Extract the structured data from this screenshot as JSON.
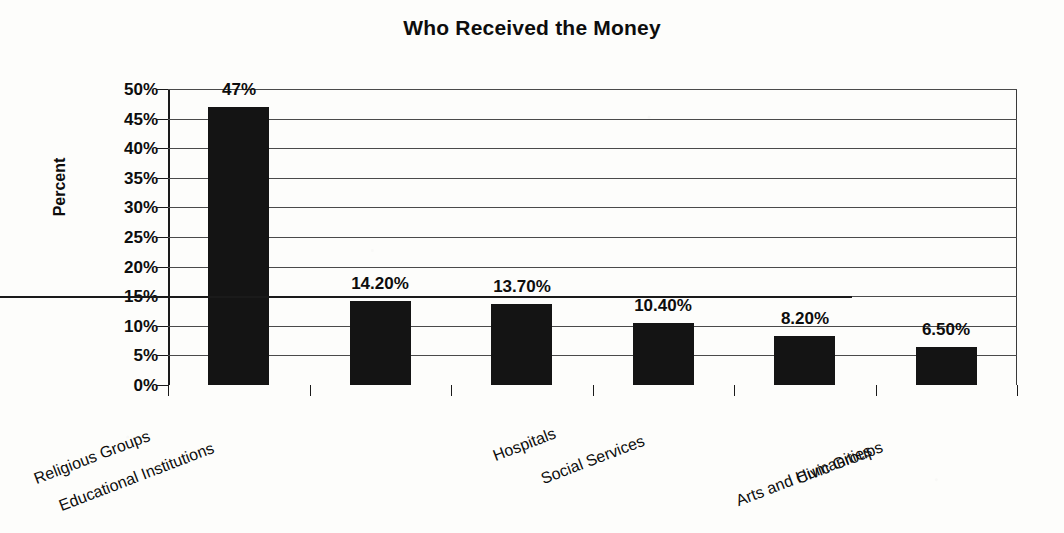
{
  "chart_data": {
    "type": "bar",
    "title": "Who Received the Money",
    "xlabel": "",
    "ylabel": "Percent",
    "ylim": [
      0,
      50
    ],
    "grid": true,
    "legend": "none",
    "categories": [
      "Religious Groups",
      "Educational Institutions",
      "Hospitals",
      "Social Services",
      "Arts and Humanities",
      "Civic Groups"
    ],
    "values": [
      47,
      14.2,
      13.7,
      10.4,
      8.2,
      6.5
    ],
    "data_labels": [
      "47%",
      "14.20%",
      "13.70%",
      "10.40%",
      "8.20%",
      "6.50%"
    ],
    "ytick_labels": [
      "50%",
      "45%",
      "40%",
      "35%",
      "30%",
      "25%",
      "20%",
      "15%",
      "10%",
      "5%",
      "0%"
    ],
    "ytick_values": [
      50,
      45,
      40,
      35,
      30,
      25,
      20,
      15,
      10,
      5,
      0
    ],
    "series": [
      {
        "name": "Percent",
        "values": [
          47,
          14.2,
          13.7,
          10.4,
          8.2,
          6.5
        ]
      }
    ],
    "colors": {
      "bar": "#141414",
      "axis": "#1a1a1a",
      "gridline": "#4a4a4a",
      "text": "#0d0d0d",
      "background": "#fdfdfb"
    }
  }
}
